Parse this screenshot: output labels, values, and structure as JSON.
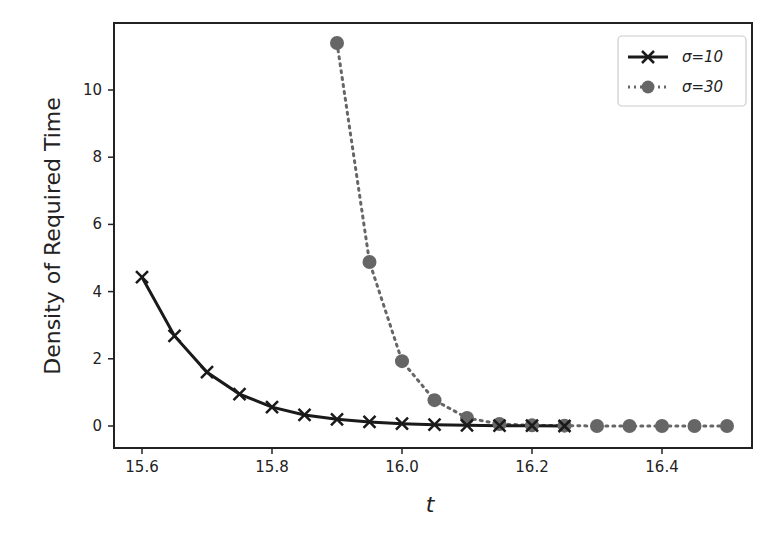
{
  "chart_data": {
    "type": "line",
    "title": "",
    "xlabel": "t",
    "ylabel": "Density of Required Time",
    "xlim": [
      15.556,
      16.536
    ],
    "ylim": [
      -0.65,
      12.0
    ],
    "xticks": [
      15.6,
      15.8,
      16.0,
      16.2,
      16.4
    ],
    "xtick_labels": [
      "15.6",
      "15.8",
      "16.0",
      "16.2",
      "16.4"
    ],
    "yticks": [
      0,
      2,
      4,
      6,
      8,
      10
    ],
    "ytick_labels": [
      "0",
      "2",
      "4",
      "6",
      "8",
      "10"
    ],
    "grid": false,
    "legend_position": "upper right",
    "series": [
      {
        "name": "σ=10",
        "style": "solid",
        "marker": "x",
        "color": "#1a1a1a",
        "x": [
          15.6,
          15.65,
          15.7,
          15.75,
          15.8,
          15.85,
          15.9,
          15.95,
          16.0,
          16.05,
          16.1,
          16.15,
          16.2,
          16.25
        ],
        "values": [
          4.43,
          2.68,
          1.6,
          0.95,
          0.56,
          0.33,
          0.2,
          0.12,
          0.07,
          0.04,
          0.02,
          0.01,
          0.01,
          0.0
        ]
      },
      {
        "name": "σ=30",
        "style": "dotted",
        "marker": "o",
        "color": "#666666",
        "x": [
          15.9,
          15.95,
          16.0,
          16.05,
          16.1,
          16.15,
          16.2,
          16.25,
          16.3,
          16.35,
          16.4,
          16.45,
          16.5
        ],
        "values": [
          11.4,
          4.88,
          1.93,
          0.77,
          0.24,
          0.06,
          0.02,
          0.01,
          0.0,
          0.0,
          0.0,
          0.0,
          0.0
        ]
      }
    ]
  },
  "legend": {
    "items": [
      {
        "label": "σ=10"
      },
      {
        "label": "σ=30"
      }
    ]
  }
}
